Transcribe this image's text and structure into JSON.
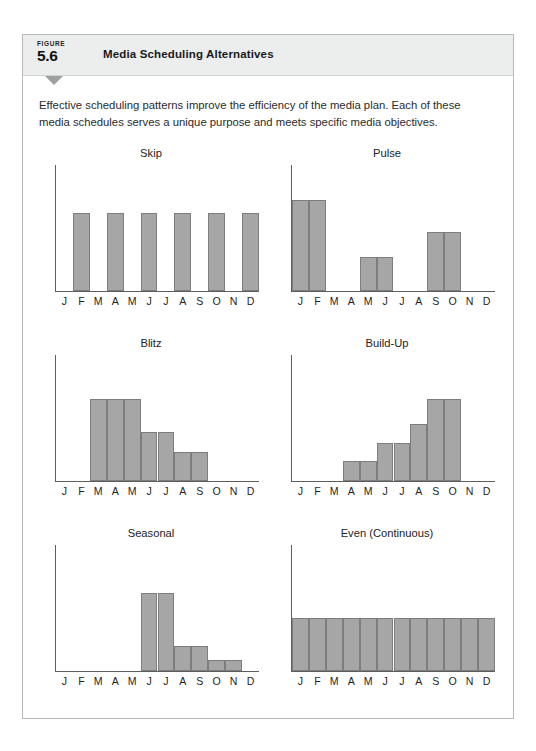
{
  "figure": {
    "figure_word": "FIGURE",
    "number": "5.6",
    "title": "Media Scheduling Alternatives",
    "intro": "Effective scheduling patterns improve the efficiency of the media plan. Each of these media schedules serves a unique purpose and meets specific media objectives."
  },
  "colors": {
    "header_band": "#eceeee",
    "bar_fill": "#a6a6a6",
    "bar_stroke": "#7d7d7d",
    "axis": "#5d5d5d",
    "panel_border": "#b9b9b9",
    "tab_triangle": "#9da0a0"
  },
  "months": [
    "J",
    "F",
    "M",
    "A",
    "M",
    "J",
    "J",
    "A",
    "S",
    "O",
    "N",
    "D"
  ],
  "chart_data": [
    {
      "type": "bar",
      "title": "Skip",
      "xlabel": "",
      "ylabel": "",
      "ylim": [
        0,
        100
      ],
      "grid": false,
      "legend": "none",
      "categories": [
        "J",
        "F",
        "M",
        "A",
        "M",
        "J",
        "J",
        "A",
        "S",
        "O",
        "N",
        "D"
      ],
      "values": [
        0,
        62,
        0,
        62,
        0,
        62,
        0,
        62,
        0,
        62,
        0,
        62
      ]
    },
    {
      "type": "bar",
      "title": "Pulse",
      "xlabel": "",
      "ylabel": "",
      "ylim": [
        0,
        100
      ],
      "grid": false,
      "legend": "none",
      "categories": [
        "J",
        "F",
        "M",
        "A",
        "M",
        "J",
        "J",
        "A",
        "S",
        "O",
        "N",
        "D"
      ],
      "values": [
        72,
        72,
        0,
        0,
        27,
        27,
        0,
        0,
        47,
        47,
        0,
        0
      ]
    },
    {
      "type": "bar",
      "title": "Blitz",
      "xlabel": "",
      "ylabel": "",
      "ylim": [
        0,
        100
      ],
      "grid": false,
      "legend": "none",
      "categories": [
        "J",
        "F",
        "M",
        "A",
        "M",
        "J",
        "J",
        "A",
        "S",
        "O",
        "N",
        "D"
      ],
      "values": [
        0,
        0,
        65,
        65,
        65,
        39,
        39,
        23,
        23,
        0,
        0,
        0
      ]
    },
    {
      "type": "bar",
      "title": "Build-Up",
      "xlabel": "",
      "ylabel": "",
      "ylim": [
        0,
        100
      ],
      "grid": false,
      "legend": "none",
      "categories": [
        "J",
        "F",
        "M",
        "A",
        "M",
        "J",
        "J",
        "A",
        "S",
        "O",
        "N",
        "D"
      ],
      "values": [
        0,
        0,
        0,
        16,
        16,
        30,
        30,
        45,
        65,
        65,
        0,
        0
      ]
    },
    {
      "type": "bar",
      "title": "Seasonal",
      "xlabel": "",
      "ylabel": "",
      "ylim": [
        0,
        100
      ],
      "grid": false,
      "legend": "none",
      "categories": [
        "J",
        "F",
        "M",
        "A",
        "M",
        "J",
        "J",
        "A",
        "S",
        "O",
        "N",
        "D"
      ],
      "values": [
        0,
        0,
        0,
        0,
        0,
        62,
        62,
        20,
        20,
        9,
        9,
        0
      ]
    },
    {
      "type": "bar",
      "title": "Even (Continuous)",
      "xlabel": "",
      "ylabel": "",
      "ylim": [
        0,
        100
      ],
      "grid": false,
      "legend": "none",
      "categories": [
        "J",
        "F",
        "M",
        "A",
        "M",
        "J",
        "J",
        "A",
        "S",
        "O",
        "N",
        "D"
      ],
      "values": [
        42,
        42,
        42,
        42,
        42,
        42,
        42,
        42,
        42,
        42,
        42,
        42
      ]
    }
  ]
}
